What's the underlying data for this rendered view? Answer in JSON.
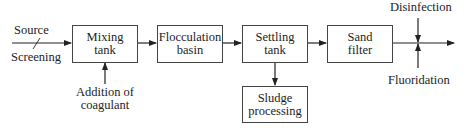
{
  "diagram": {
    "type": "water-treatment-process-flow",
    "inputs": {
      "source": "Source",
      "screening": "Screening",
      "coagulant_line1": "Addition of",
      "coagulant_line2": "coagulant",
      "disinfection": "Disinfection",
      "fluoridation": "Fluoridation"
    },
    "boxes": [
      {
        "id": "mixing",
        "line1": "Mixing",
        "line2": "tank"
      },
      {
        "id": "flocculation",
        "line1": "Flocculation",
        "line2": "basin"
      },
      {
        "id": "settling",
        "line1": "Settling",
        "line2": "tank"
      },
      {
        "id": "sand",
        "line1": "Sand",
        "line2": "filter"
      },
      {
        "id": "sludge",
        "line1": "Sludge",
        "line2": "processing"
      }
    ],
    "colors": {
      "line": "#222222",
      "box_border": "#444444",
      "background": "#ffffff"
    }
  }
}
